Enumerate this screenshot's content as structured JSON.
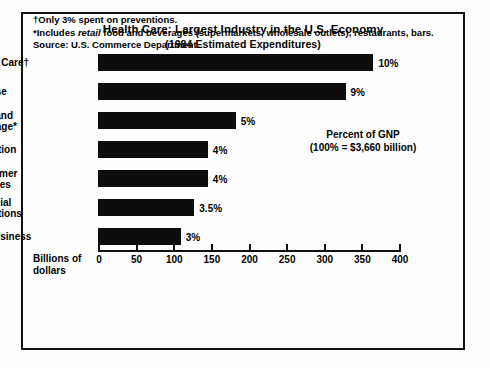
{
  "chart_data": {
    "type": "bar",
    "orientation": "horizontal",
    "title": "Health Care: Largest Industry in the U.S. Economy",
    "subtitle": "(1984 Estimated Expenditures)",
    "xlabel": "Billions of\ndollars",
    "ylabel": "",
    "xlim": [
      0,
      400
    ],
    "xticks": [
      0,
      50,
      100,
      150,
      200,
      250,
      300,
      350,
      400
    ],
    "xticklabels": [
      "0",
      "50",
      "100",
      "150",
      "200",
      "250",
      "300",
      "350",
      "400"
    ],
    "grid": false,
    "legend": false,
    "categories": [
      "Health Care†",
      "Defense",
      "Food and\nBeverage*",
      "Education",
      "Consumer\nDurables",
      "Financial\nInstitutions",
      "Agribusiness"
    ],
    "values": [
      366,
      329,
      183,
      146,
      146,
      128,
      110
    ],
    "data_labels": [
      "10%",
      "9%",
      "5%",
      "4%",
      "4%",
      "3.5%",
      "3%"
    ],
    "percent_of_gnp": [
      10,
      9,
      5,
      4,
      4,
      3.5,
      3
    ],
    "annotations": [
      "Percent of GNP",
      "(100% = $3,660 billion)"
    ],
    "footnotes": [
      "†Only 3% spent on preventions.",
      "*Includes retail food and beverages (supermarkets, wholesale outlets), restaurants, bars.",
      "Source: U.S. Commerce Department."
    ],
    "colors": {
      "bar": "#0d0d0d",
      "axis": "#111111",
      "text": "#000000",
      "background": "#fefefe"
    }
  },
  "footnote_parts": {
    "dagger": {
      "marker": "†",
      "text": "Only 3% spent on preventions."
    },
    "asterisk": {
      "marker": "*",
      "before": "Includes ",
      "italic": "retail",
      "after": " food and beverages (supermarkets, wholesale outlets), restaurants, bars."
    },
    "source": "Source: U.S. Commerce Department."
  }
}
